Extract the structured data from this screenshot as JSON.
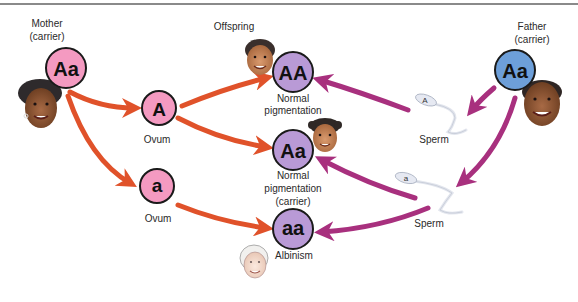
{
  "colors": {
    "maternal_allele": "#f49ac1",
    "offspring": "#b99ad6",
    "paternal_allele": "#6d9fd9",
    "maternal_arrow": "#e0522a",
    "paternal_arrow": "#a8307e",
    "outline": "#1a1a1a"
  },
  "mother": {
    "label": "Mother",
    "sublabel": "(carrier)",
    "genotype": "Aa",
    "icon": "mother-face-icon"
  },
  "father": {
    "label": "Father",
    "sublabel": "(carrier)",
    "genotype": "Aa",
    "icon": "father-face-icon"
  },
  "ova": [
    {
      "allele": "A",
      "label": "Ovum"
    },
    {
      "allele": "a",
      "label": "Ovum"
    }
  ],
  "sperm": [
    {
      "allele": "A",
      "label": "Sperm",
      "icon": "sperm-icon"
    },
    {
      "allele": "a",
      "label": "Sperm",
      "icon": "sperm-icon"
    }
  ],
  "offspring": {
    "label": "Offspring",
    "items": [
      {
        "genotype": "AA",
        "line1": "Normal",
        "line2": "pigmentation",
        "line3": "",
        "icon": "boy-face-icon"
      },
      {
        "genotype": "Aa",
        "line1": "Normal",
        "line2": "pigmentation",
        "line3": "(carrier)",
        "icon": "girl-face-icon"
      },
      {
        "genotype": "aa",
        "line1": "Albinism",
        "line2": "",
        "line3": "",
        "icon": "albino-face-icon"
      }
    ]
  }
}
